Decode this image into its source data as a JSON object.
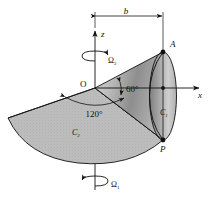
{
  "figure": {
    "type": "engineering-mechanics-diagram",
    "background_color": "#ffffff",
    "line_color": "#111111",
    "cone1_fill": "#9a9a9a",
    "cone2_fill": "#b5b5b5"
  },
  "axes": {
    "z_label": "z",
    "x_label": "x",
    "origin_label": "O"
  },
  "dimensions": {
    "b_label": "b"
  },
  "angles": {
    "upper_label": "60°",
    "lower_label": "120°"
  },
  "points": [
    {
      "name": "A",
      "label": "A"
    },
    {
      "name": "P",
      "label": "P"
    }
  ],
  "bodies": [
    {
      "name": "cone-1",
      "label": "C",
      "sub": "1"
    },
    {
      "name": "cone-2",
      "label": "C",
      "sub": "2"
    }
  ],
  "rotations": [
    {
      "name": "omega-2",
      "symbol": "Ω",
      "sub": "2",
      "position": "top"
    },
    {
      "name": "omega-1",
      "symbol": "Ω",
      "sub": "1",
      "position": "bottom"
    }
  ]
}
